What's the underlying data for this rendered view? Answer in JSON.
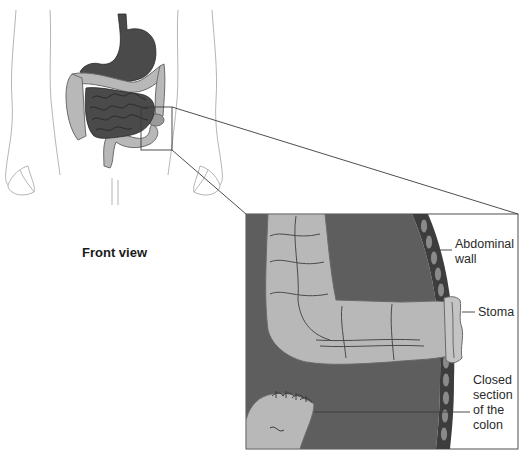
{
  "diagram": {
    "type": "medical-illustration",
    "caption": "Front view",
    "callout_labels": [
      {
        "id": "abdominal-wall",
        "lines": [
          "Abdominal",
          "wall"
        ]
      },
      {
        "id": "stoma",
        "lines": [
          "Stoma"
        ]
      },
      {
        "id": "closed-section",
        "lines": [
          "Closed",
          "section",
          "of the",
          "colon"
        ]
      }
    ],
    "colors": {
      "small_intestine": "#4a4a4a",
      "stomach": "#4a4a4a",
      "colon": "#b8b8b8",
      "callout_background": "#5e5e5e",
      "abdominal_wall": "#3d3d3d",
      "body_outline": "#b5b5b5",
      "leader_line": "#3a3a3a"
    }
  }
}
